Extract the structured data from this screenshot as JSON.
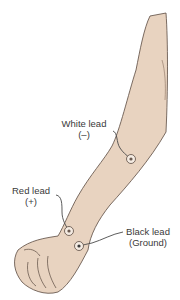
{
  "figure": {
    "colors": {
      "skin": "#e8d3c0",
      "outline": "#5a4a40",
      "lead_wire": "#4a4a4a",
      "background": "#ffffff"
    }
  },
  "labels": {
    "white_lead": {
      "name": "White lead",
      "polarity": "(–)"
    },
    "red_lead": {
      "name": "Red lead",
      "polarity": "(+)"
    },
    "black_lead": {
      "name": "Black lead",
      "polarity": "(Ground)"
    }
  }
}
